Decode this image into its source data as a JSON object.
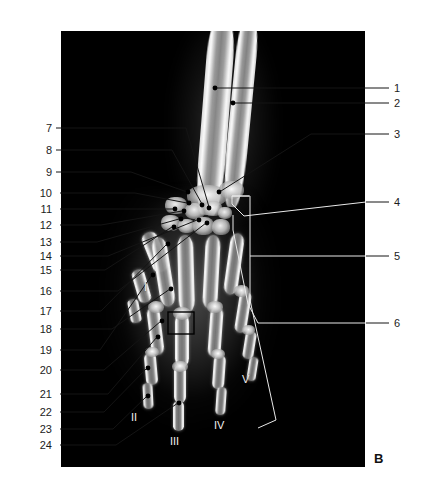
{
  "figure": {
    "panel_letter": "B",
    "plate": {
      "background_color": "#000000",
      "x": 61,
      "y": 31,
      "width": 304,
      "height": 436
    }
  },
  "labels_right": [
    {
      "id": "1",
      "text": "1",
      "x": 396,
      "y": 84,
      "marker_x": 215,
      "marker_y": 89,
      "type": "dot"
    },
    {
      "id": "2",
      "text": "2",
      "x": 396,
      "y": 100,
      "marker_x": 233,
      "marker_y": 103,
      "type": "dot"
    },
    {
      "id": "3",
      "text": "3",
      "x": 396,
      "y": 131,
      "marker_x": 219,
      "marker_y": 191,
      "type": "dot"
    },
    {
      "id": "4",
      "text": "4",
      "x": 396,
      "y": 199,
      "marker_x": 243,
      "marker_y": 215,
      "type": "bracket"
    },
    {
      "id": "5",
      "text": "5",
      "x": 396,
      "y": 253,
      "marker_x": 249,
      "marker_y": 253,
      "type": "bracket"
    },
    {
      "id": "6",
      "text": "6",
      "x": 396,
      "y": 320,
      "marker_x": 259,
      "marker_y": 320,
      "type": "bracket"
    }
  ],
  "labels_left": [
    {
      "id": "7",
      "text": "7",
      "x": 37,
      "y": 126,
      "marker_x": 207,
      "marker_y": 207
    },
    {
      "id": "8",
      "text": "8",
      "x": 37,
      "y": 148,
      "marker_x": 201,
      "marker_y": 203
    },
    {
      "id": "9",
      "text": "9",
      "x": 37,
      "y": 170,
      "marker_x": 186,
      "marker_y": 191
    },
    {
      "id": "10",
      "text": "10",
      "x": 40,
      "y": 191,
      "marker_x": 186,
      "marker_y": 202
    },
    {
      "id": "11",
      "text": "11",
      "x": 40,
      "y": 207,
      "marker_x": 174,
      "marker_y": 208
    },
    {
      "id": "12",
      "text": "12",
      "x": 40,
      "y": 223,
      "marker_x": 181,
      "marker_y": 210
    },
    {
      "id": "13",
      "text": "13",
      "x": 40,
      "y": 240,
      "marker_x": 178,
      "marker_y": 218
    },
    {
      "id": "14",
      "text": "14",
      "x": 40,
      "y": 254,
      "marker_x": 196,
      "marker_y": 219
    },
    {
      "id": "15",
      "text": "15",
      "x": 40,
      "y": 268,
      "marker_x": 172,
      "marker_y": 226
    },
    {
      "id": "16",
      "text": "16",
      "x": 40,
      "y": 289,
      "marker_x": 205,
      "marker_y": 222
    },
    {
      "id": "17",
      "text": "17",
      "x": 40,
      "y": 309,
      "marker_x": 167,
      "marker_y": 243
    },
    {
      "id": "18",
      "text": "18",
      "x": 40,
      "y": 327,
      "marker_x": 169,
      "marker_y": 288
    },
    {
      "id": "19",
      "text": "19",
      "x": 40,
      "y": 348,
      "marker_x": 152,
      "marker_y": 274
    },
    {
      "id": "20",
      "text": "20",
      "x": 40,
      "y": 368,
      "marker_x": 161,
      "marker_y": 320
    },
    {
      "id": "21",
      "text": "21",
      "x": 40,
      "y": 392,
      "marker_x": 156,
      "marker_y": 336
    },
    {
      "id": "22",
      "text": "22",
      "x": 40,
      "y": 410,
      "marker_x": 147,
      "marker_y": 367
    },
    {
      "id": "23",
      "text": "23",
      "x": 40,
      "y": 427,
      "marker_x": 147,
      "marker_y": 395
    },
    {
      "id": "24",
      "text": "24",
      "x": 40,
      "y": 443,
      "marker_x": 178,
      "marker_y": 402
    }
  ],
  "digit_labels": [
    {
      "id": "I",
      "text": "I",
      "x": 144,
      "y": 287
    },
    {
      "id": "II",
      "text": "II",
      "x": 133,
      "y": 417
    },
    {
      "id": "III",
      "text": "III",
      "x": 172,
      "y": 441
    },
    {
      "id": "IV",
      "text": "IV",
      "x": 216,
      "y": 425
    },
    {
      "id": "V",
      "text": "V",
      "x": 243,
      "y": 379
    }
  ],
  "highlight_box": {
    "x": 168,
    "y": 312,
    "width": 26,
    "height": 22
  }
}
